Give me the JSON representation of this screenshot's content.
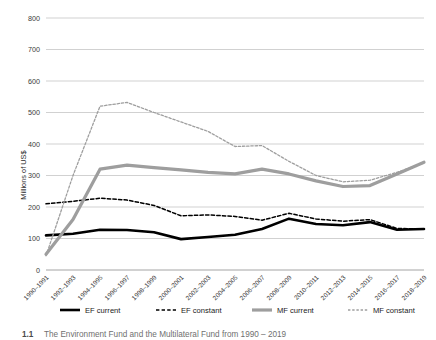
{
  "chart_data": {
    "type": "line",
    "title": "",
    "xlabel": "",
    "ylabel": "Millions of US$",
    "ylim": [
      0,
      800
    ],
    "yticks": [
      0,
      100,
      200,
      300,
      400,
      500,
      600,
      700,
      800
    ],
    "ytick_labels": [
      "0",
      "100",
      "200",
      "300",
      "400",
      "500",
      "600",
      "700",
      "800"
    ],
    "grid": true,
    "legend_position": "bottom",
    "categories": [
      "1990–1991",
      "1992–1993",
      "1994–1995",
      "1996–1997",
      "1998–1999",
      "2000–2001",
      "2002–2003",
      "2004–2005",
      "2006–2007",
      "2008–2009",
      "2010–2011",
      "2012–2013",
      "2014–2015",
      "2016–2017",
      "2018–2019"
    ],
    "series": [
      {
        "name": "EF current",
        "color": "#000000",
        "style": "solid",
        "width": 2.6,
        "values": [
          110,
          115,
          128,
          127,
          120,
          98,
          105,
          112,
          130,
          163,
          146,
          142,
          152,
          128,
          130
        ]
      },
      {
        "name": "EF constant",
        "color": "#000000",
        "style": "dashed",
        "width": 1.5,
        "values": [
          210,
          218,
          228,
          222,
          205,
          172,
          175,
          170,
          158,
          180,
          162,
          155,
          160,
          132,
          130
        ]
      },
      {
        "name": "MF current",
        "color": "#9e9e9e",
        "style": "solid",
        "width": 3.2,
        "values": [
          50,
          160,
          320,
          333,
          325,
          318,
          310,
          305,
          320,
          305,
          283,
          265,
          268,
          305,
          342
        ]
      },
      {
        "name": "MF constant",
        "color": "#9e9e9e",
        "style": "dashed",
        "width": 1.3,
        "values": [
          45,
          300,
          520,
          532,
          500,
          470,
          440,
          392,
          395,
          345,
          300,
          280,
          285,
          310,
          340
        ]
      }
    ]
  },
  "caption": {
    "number": "1.1",
    "text": "The Environment Fund and the Multilateral Fund from 1990 – 2019"
  },
  "legend": {
    "items": [
      {
        "label": "EF current"
      },
      {
        "label": "EF constant"
      },
      {
        "label": "MF current"
      },
      {
        "label": "MF constant"
      }
    ]
  }
}
